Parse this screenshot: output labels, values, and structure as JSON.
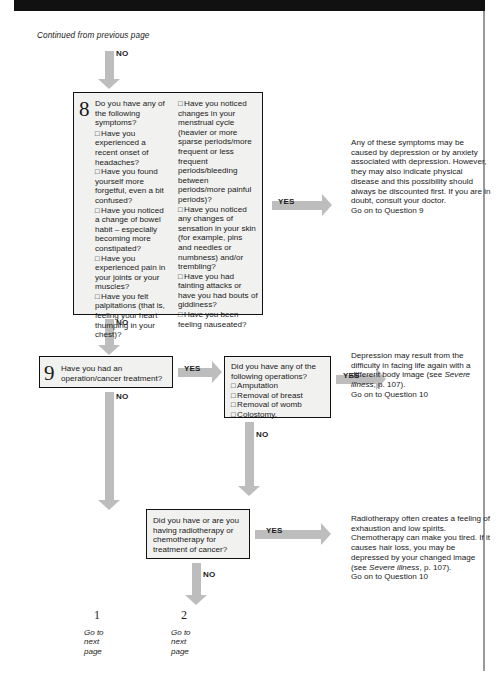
{
  "page": {
    "continued_note": "Continued from previous page"
  },
  "arrows": {
    "no_label": "NO",
    "yes_label": "YES"
  },
  "questions": {
    "q8": {
      "number": "8",
      "lead": "Do you have any of the following symptoms?",
      "left_items": [
        "Have you experienced a recent onset of headaches?",
        "Have you found yourself more forgetful, even a bit confused?",
        "Have you noticed a change of bowel habit – especially becoming more constipated?",
        "Have you experienced pain in your joints or your muscles?",
        "Have you felt palpitations (that is, feeling your heart thumping in your chest)?"
      ],
      "right_items": [
        "Have you noticed changes in your menstrual cycle (heavier or more sparse periods/more frequent or less frequent periods/bleeding between periods/more painful periods)?",
        "Have you noticed any changes of sensation in your skin (for example, pins and needles or numbness) and/or trembling?",
        "Have you had fainting attacks or have you had bouts of giddiness?",
        "Have you been feeling nauseated?"
      ]
    },
    "q9": {
      "number": "9",
      "text": "Have you had an operation/cancer treatment?"
    },
    "operations": {
      "lead": "Did you have any of the following operations?",
      "items": [
        "Amputation",
        "Removal of breast",
        "Removal of womb",
        "Colostomy."
      ]
    },
    "radiotherapy": {
      "text": "Did you have or are you having radiotherapy or chemotherapy for treatment of cancer?"
    }
  },
  "answers": {
    "q8_yes": {
      "body": "Any of these symptoms may be caused by depression or by anxiety associated with depression. However, they may also indicate physical disease and this possibility should always be discounted first. If you are in doubt, consult your doctor.",
      "next": "Go on to Question 9"
    },
    "operations_yes": {
      "before_ref": "Depression may result from the difficulty in facing life again with a different body image (see ",
      "ref": "Severe illness",
      "after_ref": ", p. 107).",
      "next": "Go on to Question 10"
    },
    "radiotherapy_yes": {
      "before_ref": "Radiotherapy often creates a feeling of exhaustion and low spirits. Chemotherapy can make you tired. If it causes hair loss, you may be depressed by your changed image (see ",
      "ref": "Severe illness",
      "after_ref": ", p. 107).",
      "next": "Go on to Question 10"
    }
  },
  "footer": {
    "left": {
      "marker": "1",
      "line1": "Go to",
      "line2": "next",
      "line3": "page"
    },
    "right": {
      "marker": "2",
      "line1": "Go to",
      "line2": "next",
      "line3": "page"
    }
  },
  "colors": {
    "arrow": "#bdbdbd",
    "box_fill": "#f1f1ef",
    "box_border": "#111111",
    "banner": "#111111"
  }
}
